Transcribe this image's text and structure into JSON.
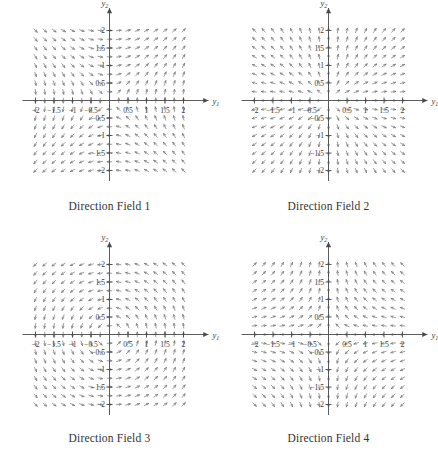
{
  "figure": {
    "panel_count": 4,
    "axis": {
      "x_label": "y",
      "x_sub": "1",
      "y_label": "y",
      "y_sub": "2",
      "x_ticks": [
        "-2",
        "-1.5",
        "-1",
        "-0.5",
        "0.5",
        "1",
        "1.5",
        "2"
      ],
      "y_ticks": [
        "2",
        "1.5",
        "1",
        "0.5",
        "-0.5",
        "-1",
        "-1.5",
        "-2"
      ],
      "x_min": -2.35,
      "x_max": 2.35,
      "y_min": -2.3,
      "y_max": 2.3,
      "tick_values": [
        -2,
        -1.5,
        -1,
        -0.5,
        0.5,
        1,
        1.5,
        2
      ]
    },
    "style": {
      "vector_color": "#7b7b7b",
      "axis_color": "#4a4a4a",
      "text_color": "#3a3a3a",
      "background": "#ffffff"
    }
  },
  "chart_data": {
    "type": "scatter",
    "title": "",
    "xlabel": "y1",
    "ylabel": "y2",
    "xlim": [
      -2.35,
      2.35
    ],
    "ylim": [
      -2.3,
      2.3
    ],
    "grid": false,
    "legend": "none",
    "sample_grid": {
      "x_start": -2.0,
      "x_end": 2.0,
      "y_start": -2.0,
      "y_end": 2.0,
      "step": 0.25
    },
    "panels": [
      {
        "id": 1,
        "caption": "Direction Field 1",
        "matrix": [
          [
            0,
            1
          ],
          [
            1,
            0
          ]
        ],
        "dy1": "y2",
        "dy2": "y1",
        "pattern": "saddle",
        "note": "Near-horizontal arrows along y2 axis extremes; vertical arrows where |y1| large; flow bends around origin."
      },
      {
        "id": 2,
        "caption": "Direction Field 2",
        "matrix": [
          [
            1,
            0
          ],
          [
            0,
            1
          ]
        ],
        "dy1": "y1",
        "dy2": "y2",
        "pattern": "unstable-node-radial",
        "note": "Arrows point radially outward from the origin; slope equals y2/y1."
      },
      {
        "id": 3,
        "caption": "Direction Field 3",
        "matrix": [
          [
            0,
            -1
          ],
          [
            1,
            0
          ]
        ],
        "dy1": "-y2",
        "dy2": "y1",
        "pattern": "center-rotation",
        "note": "Closed circular rotation about the origin; arrows tangent to circles."
      },
      {
        "id": 4,
        "caption": "Direction Field 4",
        "matrix": [
          [
            -1,
            0
          ],
          [
            0,
            1
          ]
        ],
        "dy1": "-y1",
        "dy2": "y2",
        "pattern": "saddle-axis-aligned",
        "note": "Contraction along y1, expansion along y2; arrows sweep from horizontal to vertical."
      }
    ]
  }
}
